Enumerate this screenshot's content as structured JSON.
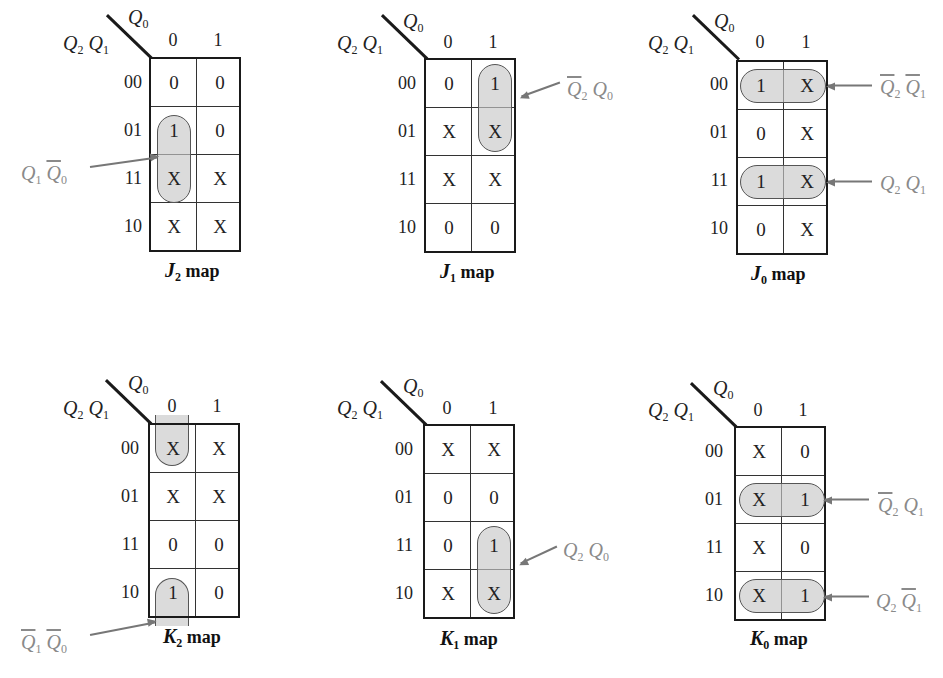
{
  "row_var_label": {
    "a": "Q",
    "a_sub": "2",
    "b": "Q",
    "b_sub": "1"
  },
  "col_var_label": {
    "a": "Q",
    "a_sub": "0"
  },
  "row_labels": [
    "00",
    "01",
    "11",
    "10"
  ],
  "col_labels": [
    "0",
    "1"
  ],
  "map_suffix": "map",
  "maps": {
    "J2": {
      "title_fn": "J",
      "title_sub": "2",
      "cells": [
        [
          "0",
          "0"
        ],
        [
          "1",
          "0"
        ],
        [
          "X",
          "X"
        ],
        [
          "X",
          "X"
        ]
      ],
      "groups": [
        {
          "term": "Q1 Q0'",
          "t1": "Q",
          "t1_sub": "1",
          "t1_bar": false,
          "t2": "Q",
          "t2_sub": "0",
          "t2_bar": true,
          "cells": [
            [
              1,
              0
            ],
            [
              2,
              0
            ]
          ]
        }
      ]
    },
    "J1": {
      "title_fn": "J",
      "title_sub": "1",
      "cells": [
        [
          "0",
          "1"
        ],
        [
          "X",
          "X"
        ],
        [
          "X",
          "X"
        ],
        [
          "0",
          "0"
        ]
      ],
      "groups": [
        {
          "term": "Q2' Q0",
          "t1": "Q",
          "t1_sub": "2",
          "t1_bar": true,
          "t2": "Q",
          "t2_sub": "0",
          "t2_bar": false,
          "cells": [
            [
              0,
              1
            ],
            [
              1,
              1
            ]
          ]
        }
      ]
    },
    "J0": {
      "title_fn": "J",
      "title_sub": "0",
      "cells": [
        [
          "1",
          "X"
        ],
        [
          "0",
          "X"
        ],
        [
          "1",
          "X"
        ],
        [
          "0",
          "X"
        ]
      ],
      "groups": [
        {
          "term": "Q2' Q1'",
          "t1": "Q",
          "t1_sub": "2",
          "t1_bar": true,
          "t2": "Q",
          "t2_sub": "1",
          "t2_bar": true,
          "cells": [
            [
              0,
              0
            ],
            [
              0,
              1
            ]
          ]
        },
        {
          "term": "Q2 Q1",
          "t1": "Q",
          "t1_sub": "2",
          "t1_bar": false,
          "t2": "Q",
          "t2_sub": "1",
          "t2_bar": false,
          "cells": [
            [
              2,
              0
            ],
            [
              2,
              1
            ]
          ]
        }
      ]
    },
    "K2": {
      "title_fn": "K",
      "title_sub": "2",
      "cells": [
        [
          "X",
          "X"
        ],
        [
          "X",
          "X"
        ],
        [
          "0",
          "0"
        ],
        [
          "1",
          "0"
        ]
      ],
      "groups": [
        {
          "term": "Q1' Q0'",
          "t1": "Q",
          "t1_sub": "1",
          "t1_bar": true,
          "t2": "Q",
          "t2_sub": "0",
          "t2_bar": true,
          "cells": [
            [
              0,
              0
            ],
            [
              3,
              0
            ]
          ],
          "wraparound": true
        }
      ]
    },
    "K1": {
      "title_fn": "K",
      "title_sub": "1",
      "cells": [
        [
          "X",
          "X"
        ],
        [
          "0",
          "0"
        ],
        [
          "0",
          "1"
        ],
        [
          "X",
          "X"
        ]
      ],
      "groups": [
        {
          "term": "Q2 Q0",
          "t1": "Q",
          "t1_sub": "2",
          "t1_bar": false,
          "t2": "Q",
          "t2_sub": "0",
          "t2_bar": false,
          "cells": [
            [
              2,
              1
            ],
            [
              3,
              1
            ]
          ]
        }
      ]
    },
    "K0": {
      "title_fn": "K",
      "title_sub": "0",
      "cells": [
        [
          "X",
          "0"
        ],
        [
          "X",
          "1"
        ],
        [
          "X",
          "0"
        ],
        [
          "X",
          "1"
        ]
      ],
      "groups": [
        {
          "term": "Q2' Q1",
          "t1": "Q",
          "t1_sub": "2",
          "t1_bar": true,
          "t2": "Q",
          "t2_sub": "1",
          "t2_bar": false,
          "cells": [
            [
              1,
              0
            ],
            [
              1,
              1
            ]
          ]
        },
        {
          "term": "Q2 Q1'",
          "t1": "Q",
          "t1_sub": "2",
          "t1_bar": false,
          "t2": "Q",
          "t2_sub": "1",
          "t2_bar": true,
          "cells": [
            [
              3,
              0
            ],
            [
              3,
              1
            ]
          ]
        }
      ]
    }
  },
  "colors": {
    "grid": "#1a1a1a",
    "loop_fill": "#d0d0d0",
    "loop_border": "#555555",
    "term_text": "#8a8a8a",
    "arrow": "#777777"
  }
}
